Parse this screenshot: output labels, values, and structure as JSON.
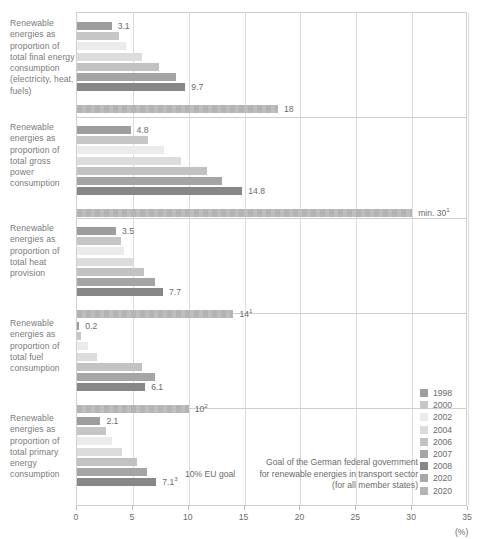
{
  "chart_data": {
    "type": "bar",
    "orientation": "horizontal",
    "title": "",
    "subtitle": "",
    "xlabel": "(%)",
    "ylabel": "",
    "xlim": [
      0,
      35
    ],
    "xticks": [
      0,
      5,
      10,
      15,
      20,
      25,
      30,
      35
    ],
    "xtick_labels": [
      "0",
      "5",
      "10",
      "15",
      "20",
      "25",
      "30",
      "35"
    ],
    "grid": true,
    "legend_position": "right",
    "legend": [
      {
        "label": "1998",
        "color": "#9d9d9d"
      },
      {
        "label": "2000",
        "color": "#c6c6c6"
      },
      {
        "label": "2002",
        "color": "#ebebeb"
      },
      {
        "label": "2004",
        "color": "#dcdcdc"
      },
      {
        "label": "2006",
        "color": "#c2c2c2"
      },
      {
        "label": "2007",
        "color": "#a5a5a5"
      },
      {
        "label": "2008",
        "color": "#878787"
      },
      {
        "label": "2020",
        "color": "#a8a8a8"
      },
      {
        "label": "2020",
        "color": "#b4b4b4"
      }
    ],
    "series": [
      {
        "name": "1998",
        "color": "#9d9d9d",
        "values": [
          3.1,
          4.8,
          3.5,
          0.2,
          2.1
        ]
      },
      {
        "name": "2000",
        "color": "#c6c6c6",
        "values": [
          3.8,
          6.4,
          3.9,
          0.4,
          2.6
        ]
      },
      {
        "name": "2002",
        "color": "#ebebeb",
        "values": [
          4.4,
          7.8,
          4.2,
          1.0,
          3.1
        ]
      },
      {
        "name": "2004",
        "color": "#dcdcdc",
        "values": [
          5.8,
          9.3,
          5.1,
          1.8,
          4.0
        ]
      },
      {
        "name": "2006",
        "color": "#c2c2c2",
        "values": [
          7.3,
          11.6,
          6.0,
          5.8,
          5.4
        ]
      },
      {
        "name": "2007",
        "color": "#a5a5a5",
        "values": [
          8.9,
          13.0,
          7.0,
          7.0,
          6.3
        ]
      },
      {
        "name": "2008",
        "color": "#878787",
        "values": [
          9.7,
          14.8,
          7.7,
          6.1,
          7.1
        ]
      },
      {
        "name": "2020",
        "color": "#b4b4b4",
        "values": [
          18,
          30,
          14,
          10,
          null
        ]
      }
    ],
    "categories": [
      "Renewable energies as proportion of total final energy consumption (electricity, heat, fuels)",
      "Renewable energies as proportion of total gross power consumption",
      "Renewable energies as proportion of total heat provision",
      "Renewable energies as proportion of total fuel consumption",
      "Renewable energies as proportion of total primary energy consumption"
    ],
    "annotations": [
      "Goal of the German federal government",
      "10% EU goal for renewable energies in transport sector",
      "(for all member states)"
    ]
  },
  "groups": [
    {
      "label": "Renewable energies as proportion of total final energy consumption (electricity, heat, fuels)",
      "top": 12,
      "height": 104,
      "bars": [
        {
          "year": "1998",
          "value": 3.1,
          "label": "3.1",
          "sup": "",
          "color": "#9d9d9d",
          "labeled": true
        },
        {
          "year": "2000",
          "value": 3.8,
          "label": "",
          "sup": "",
          "color": "#c6c6c6",
          "labeled": false
        },
        {
          "year": "2002",
          "value": 4.4,
          "label": "",
          "sup": "",
          "color": "#ebebeb",
          "labeled": false
        },
        {
          "year": "2004",
          "value": 5.8,
          "label": "",
          "sup": "",
          "color": "#dcdcdc",
          "labeled": false
        },
        {
          "year": "2006",
          "value": 7.3,
          "label": "",
          "sup": "",
          "color": "#c2c2c2",
          "labeled": false
        },
        {
          "year": "2007",
          "value": 8.9,
          "label": "",
          "sup": "",
          "color": "#a5a5a5",
          "labeled": false
        },
        {
          "year": "2008",
          "value": 9.7,
          "label": "9.7",
          "sup": "",
          "color": "#878787",
          "labeled": true
        },
        {
          "year": "2020",
          "value": 18,
          "label": "18",
          "sup": "",
          "color": "#b4b4b4",
          "labeled": true,
          "goal": true
        }
      ]
    },
    {
      "label": "Renewable energies as proportion of total gross power consumption",
      "top": 116,
      "height": 101,
      "bars": [
        {
          "year": "1998",
          "value": 4.8,
          "label": "4.8",
          "sup": "",
          "color": "#9d9d9d",
          "labeled": true
        },
        {
          "year": "2000",
          "value": 6.4,
          "label": "",
          "sup": "",
          "color": "#c6c6c6",
          "labeled": false
        },
        {
          "year": "2002",
          "value": 7.8,
          "label": "",
          "sup": "",
          "color": "#ebebeb",
          "labeled": false
        },
        {
          "year": "2004",
          "value": 9.3,
          "label": "",
          "sup": "",
          "color": "#dcdcdc",
          "labeled": false
        },
        {
          "year": "2006",
          "value": 11.6,
          "label": "",
          "sup": "",
          "color": "#c2c2c2",
          "labeled": false
        },
        {
          "year": "2007",
          "value": 13.0,
          "label": "",
          "sup": "",
          "color": "#a5a5a5",
          "labeled": false
        },
        {
          "year": "2008",
          "value": 14.8,
          "label": "14.8",
          "sup": "",
          "color": "#878787",
          "labeled": true
        },
        {
          "year": "2020",
          "value": 30,
          "label": "min. 30",
          "sup": "1",
          "color": "#b4b4b4",
          "labeled": true,
          "goal": true
        }
      ]
    },
    {
      "label": "Renewable energies as proportion of total heat provision",
      "top": 217,
      "height": 95,
      "bars": [
        {
          "year": "1998",
          "value": 3.5,
          "label": "3.5",
          "sup": "",
          "color": "#9d9d9d",
          "labeled": true
        },
        {
          "year": "2000",
          "value": 3.9,
          "label": "",
          "sup": "",
          "color": "#c6c6c6",
          "labeled": false
        },
        {
          "year": "2002",
          "value": 4.2,
          "label": "",
          "sup": "",
          "color": "#ebebeb",
          "labeled": false
        },
        {
          "year": "2004",
          "value": 5.1,
          "label": "",
          "sup": "",
          "color": "#dcdcdc",
          "labeled": false
        },
        {
          "year": "2006",
          "value": 6.0,
          "label": "",
          "sup": "",
          "color": "#c2c2c2",
          "labeled": false
        },
        {
          "year": "2007",
          "value": 7.0,
          "label": "",
          "sup": "",
          "color": "#a5a5a5",
          "labeled": false
        },
        {
          "year": "2008",
          "value": 7.7,
          "label": "7.7",
          "sup": "",
          "color": "#878787",
          "labeled": true
        },
        {
          "year": "2020",
          "value": 14,
          "label": "14",
          "sup": "1",
          "color": "#b4b4b4",
          "labeled": true,
          "goal": true
        }
      ]
    },
    {
      "label": "Renewable energies as proportion of total fuel consumption",
      "top": 312,
      "height": 95,
      "bars": [
        {
          "year": "1998",
          "value": 0.2,
          "label": "0.2",
          "sup": "",
          "color": "#9d9d9d",
          "labeled": true
        },
        {
          "year": "2000",
          "value": 0.4,
          "label": "",
          "sup": "",
          "color": "#c6c6c6",
          "labeled": false
        },
        {
          "year": "2002",
          "value": 1.0,
          "label": "",
          "sup": "",
          "color": "#ebebeb",
          "labeled": false
        },
        {
          "year": "2004",
          "value": 1.8,
          "label": "",
          "sup": "",
          "color": "#dcdcdc",
          "labeled": false
        },
        {
          "year": "2006",
          "value": 5.8,
          "label": "",
          "sup": "",
          "color": "#c2c2c2",
          "labeled": false
        },
        {
          "year": "2007",
          "value": 7.0,
          "label": "",
          "sup": "",
          "color": "#a5a5a5",
          "labeled": false
        },
        {
          "year": "2008",
          "value": 6.1,
          "label": "6.1",
          "sup": "",
          "color": "#878787",
          "labeled": true
        },
        {
          "year": "2020",
          "value": 10,
          "label": "10",
          "sup": "2",
          "color": "#b4b4b4",
          "labeled": true,
          "goal": true
        }
      ]
    },
    {
      "label": "Renewable energies as proportion of total primary energy consumption",
      "top": 407,
      "height": 99,
      "bars": [
        {
          "year": "1998",
          "value": 2.1,
          "label": "2.1",
          "sup": "",
          "color": "#9d9d9d",
          "labeled": true
        },
        {
          "year": "2000",
          "value": 2.6,
          "label": "",
          "sup": "",
          "color": "#c6c6c6",
          "labeled": false
        },
        {
          "year": "2002",
          "value": 3.1,
          "label": "",
          "sup": "",
          "color": "#ebebeb",
          "labeled": false
        },
        {
          "year": "2004",
          "value": 4.0,
          "label": "",
          "sup": "",
          "color": "#dcdcdc",
          "labeled": false
        },
        {
          "year": "2006",
          "value": 5.4,
          "label": "",
          "sup": "",
          "color": "#c2c2c2",
          "labeled": false
        },
        {
          "year": "2007",
          "value": 6.3,
          "label": "",
          "sup": "",
          "color": "#a5a5a5",
          "labeled": false
        },
        {
          "year": "2008",
          "value": 7.1,
          "label": "7.1",
          "sup": "3",
          "color": "#878787",
          "labeled": true
        }
      ]
    }
  ],
  "axis": {
    "unit": "(%)",
    "ticks": [
      "0",
      "5",
      "10",
      "15",
      "20",
      "25",
      "30",
      "35"
    ]
  },
  "legend": {
    "items": [
      "1998",
      "2000",
      "2002",
      "2004",
      "2006",
      "2007",
      "2008",
      "2020",
      "2020"
    ]
  },
  "goal_note": {
    "line1": "Goal of the German federal government",
    "line2_left": "10% EU goal",
    "line2_right": "for renewable energies in transport sector",
    "line3": "(for all member states)"
  },
  "colors": {
    "grid": "#dcdcdc",
    "frame": "#cfcfcf",
    "text": "#6b6b6b",
    "label_text": "#7a7a7a"
  }
}
